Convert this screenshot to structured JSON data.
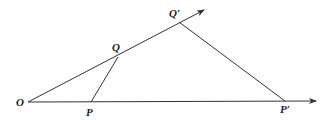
{
  "diagram": {
    "type": "geometry",
    "points": {
      "O": {
        "label": "O",
        "x": 28,
        "y": 102
      },
      "P": {
        "label": "P",
        "x": 91,
        "y": 102
      },
      "Q": {
        "label": "Q",
        "x": 118,
        "y": 57
      },
      "Q_prime": {
        "label": "Q′",
        "x": 179,
        "y": 22
      },
      "P_prime": {
        "label": "P′",
        "x": 285,
        "y": 101
      }
    },
    "rays": [
      {
        "from": "O",
        "to_x": 204,
        "to_y": 10
      },
      {
        "from": "O",
        "to_x": 316,
        "to_y": 101
      }
    ],
    "segments": [
      [
        "P",
        "Q"
      ],
      [
        "P_prime",
        "Q_prime"
      ]
    ],
    "line_color": "#333333"
  }
}
